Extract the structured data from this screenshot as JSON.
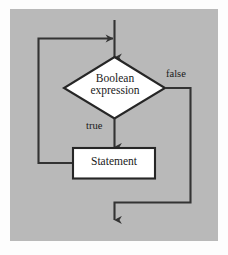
{
  "figure": {
    "background_color": "#b9b9b9",
    "page_color": "#fdfdfd",
    "line_color": "#333333",
    "node_fill": "#ffffff"
  },
  "nodes": {
    "condition": {
      "shape": "diamond",
      "text_line1": "Boolean",
      "text_line2": "expression"
    },
    "statement": {
      "shape": "rectangle",
      "text": "Statement"
    }
  },
  "edges": {
    "entry": {
      "label": "",
      "icon": "arrow-down-icon"
    },
    "true_branch": {
      "label": "true",
      "icon": "arrow-down-icon"
    },
    "false_branch": {
      "label": "false",
      "icon": "arrow-down-icon"
    },
    "loop_back": {
      "label": "",
      "icon": "arrow-right-icon"
    }
  }
}
